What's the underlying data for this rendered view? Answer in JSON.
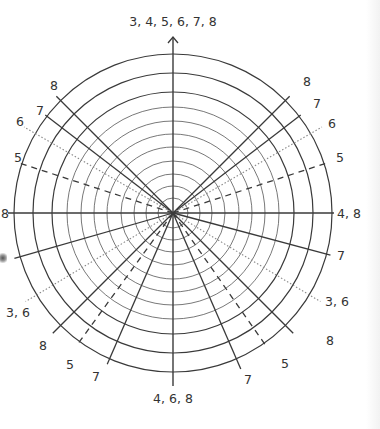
{
  "diagram": {
    "type": "polar-grid",
    "center": [
      173,
      213
    ],
    "colors": {
      "line": "#3a3a3a",
      "grid": "#555555",
      "dotted": "#8a8a8a",
      "text": "#333333",
      "background": "#ffffff"
    },
    "circles": {
      "thick_radii": [
        159,
        140,
        121
      ],
      "thin_radii": [
        106,
        92,
        79,
        66,
        52,
        39,
        27,
        15
      ]
    },
    "axes": {
      "top_label": "3, 4, 5, 6, 7, 8",
      "bottom_label": "4, 6, 8",
      "right_label": "4, 8",
      "left_label": "8"
    },
    "rays": [
      {
        "angle": 45,
        "length": 165,
        "style": "solid",
        "label": "8",
        "label_pos": [
          303,
          86
        ]
      },
      {
        "angle": 37.5,
        "length": 161,
        "style": "solid",
        "label": "7",
        "label_pos": [
          313,
          108
        ]
      },
      {
        "angle": 30,
        "length": 172,
        "style": "dotted",
        "label": "6",
        "label_pos": [
          328,
          128
        ]
      },
      {
        "angle": 18,
        "length": 161,
        "style": "dashed",
        "label": "5",
        "label_pos": [
          336,
          162
        ]
      },
      {
        "angle": 135,
        "length": 165,
        "style": "solid",
        "label": "8",
        "label_pos": [
          50,
          90
        ]
      },
      {
        "angle": 142.5,
        "length": 161,
        "style": "solid",
        "label": "7",
        "label_pos": [
          36,
          115
        ]
      },
      {
        "angle": 150,
        "length": 172,
        "style": "dotted",
        "label": "6",
        "label_pos": [
          16,
          126
        ]
      },
      {
        "angle": 162,
        "length": 161,
        "style": "dashed",
        "label": "5",
        "label_pos": [
          14,
          162
        ]
      },
      {
        "angle": -15,
        "length": 163,
        "style": "solid",
        "label": "7",
        "label_pos": [
          337,
          260
        ]
      },
      {
        "angle": -31,
        "length": 172,
        "style": "dotted",
        "label": "3, 6",
        "label_pos": [
          325,
          306
        ]
      },
      {
        "angle": -45,
        "length": 170,
        "style": "solid",
        "label": "8",
        "label_pos": [
          326,
          345
        ]
      },
      {
        "angle": -55,
        "length": 160,
        "style": "dashed",
        "label": "5",
        "label_pos": [
          281,
          368
        ]
      },
      {
        "angle": -66.5,
        "length": 170,
        "style": "solid",
        "label": "7",
        "label_pos": [
          244,
          384
        ]
      },
      {
        "angle": -113.5,
        "length": 165,
        "style": "solid",
        "label": "7",
        "label_pos": [
          92,
          381
        ]
      },
      {
        "angle": -126,
        "length": 160,
        "style": "dashed",
        "label": "5",
        "label_pos": [
          66,
          369
        ]
      },
      {
        "angle": -135,
        "length": 170,
        "style": "solid",
        "label": "8",
        "label_pos": [
          39,
          350
        ]
      },
      {
        "angle": -149,
        "length": 172,
        "style": "dotted",
        "label": "3, 6",
        "label_pos": [
          6,
          317
        ]
      },
      {
        "angle": -164,
        "length": 165,
        "style": "solid",
        "label": "",
        "label_pos": [
          0,
          0
        ]
      }
    ]
  }
}
